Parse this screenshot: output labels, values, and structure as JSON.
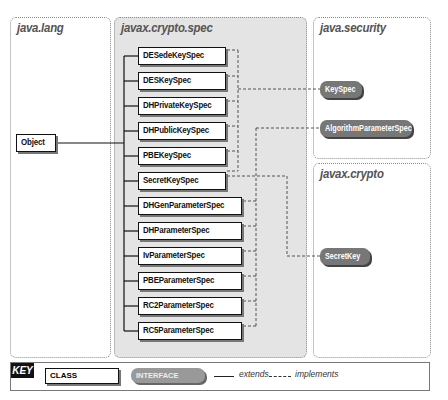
{
  "packages": {
    "java_lang": {
      "title": "java.lang"
    },
    "javax_crypto_spec": {
      "title": "javax.crypto.spec"
    },
    "java_security": {
      "title": "java.security"
    },
    "javax_crypto": {
      "title": "javax.crypto"
    }
  },
  "classes": {
    "object": "Object",
    "spec": [
      {
        "name": "DESedeKeySpec",
        "implements": "KeySpec"
      },
      {
        "name": "DESKeySpec",
        "implements": "KeySpec"
      },
      {
        "name": "DHPrivateKeySpec",
        "implements": "KeySpec"
      },
      {
        "name": "DHPublicKeySpec",
        "implements": "KeySpec"
      },
      {
        "name": "PBEKeySpec",
        "implements": "KeySpec"
      },
      {
        "name": "SecretKeySpec",
        "implements": "KeySpec, SecretKey"
      },
      {
        "name": "DHGenParameterSpec",
        "implements": "AlgorithmParameterSpec"
      },
      {
        "name": "DHParameterSpec",
        "implements": "AlgorithmParameterSpec"
      },
      {
        "name": "IvParameterSpec",
        "implements": "AlgorithmParameterSpec"
      },
      {
        "name": "PBEParameterSpec",
        "implements": "AlgorithmParameterSpec"
      },
      {
        "name": "RC2ParameterSpec",
        "implements": "AlgorithmParameterSpec"
      },
      {
        "name": "RC5ParameterSpec",
        "implements": "AlgorithmParameterSpec"
      }
    ]
  },
  "interfaces": {
    "keyspec": "KeySpec",
    "algorithm_parameter_spec": "AlgorithmParameterSpec",
    "secret_key": "SecretKey"
  },
  "key": {
    "label": "KEY",
    "class_label": "CLASS",
    "interface_label": "INTERFACE",
    "extends_label": "extends",
    "implements_label": "implements"
  },
  "colors": {
    "spec_panel_bg": "#e4e4e4",
    "interface_fill": "#777777",
    "class_border": "#111111"
  }
}
